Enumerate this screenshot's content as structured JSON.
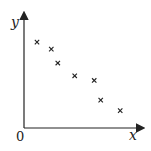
{
  "chart_data": {
    "type": "scatter",
    "title": "",
    "xlabel": "x",
    "ylabel": "y",
    "origin_label": "0",
    "marker": "×",
    "grid": false,
    "legend": null,
    "xlim": [
      0,
      10
    ],
    "ylim": [
      0,
      10
    ],
    "points": [
      {
        "x": 1.0,
        "y": 7.4
      },
      {
        "x": 2.1,
        "y": 6.8
      },
      {
        "x": 2.6,
        "y": 5.6
      },
      {
        "x": 3.9,
        "y": 4.5
      },
      {
        "x": 5.4,
        "y": 4.1
      },
      {
        "x": 5.9,
        "y": 2.4
      },
      {
        "x": 7.4,
        "y": 1.5
      }
    ],
    "colors": {
      "axis": "#222222",
      "marker": "#222222"
    }
  }
}
